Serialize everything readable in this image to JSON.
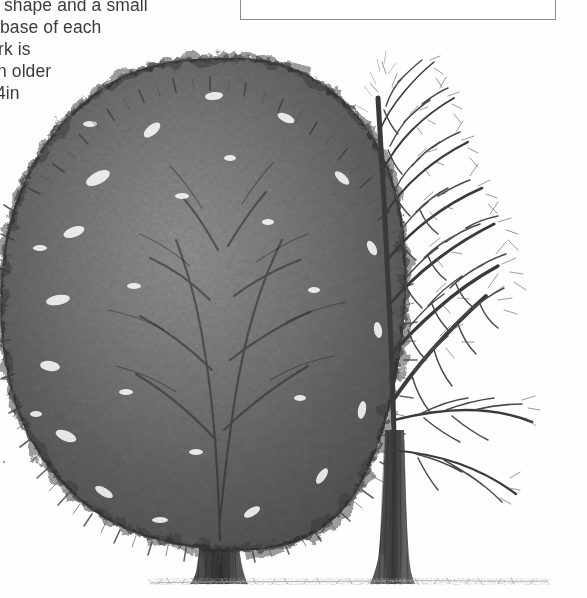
{
  "page": {
    "background_color": "#ffffff",
    "width": 587,
    "height": 598,
    "media_type": "scanned-book-page"
  },
  "body_text": {
    "note": "left column text is cropped at the left edge of the page",
    "lines": [
      "shape and a small",
      "base of each",
      "rk is",
      "n older",
      "4in"
    ]
  },
  "caption_box": {
    "border_color": "#8c8c8c",
    "fill_color": "#ffffff",
    "text": ""
  },
  "illustration": {
    "title": "Two deciduous trees",
    "style": "black-and-white pencil / halftone engraving",
    "ink_color": "#4a4a4a",
    "ground_color": "#9a9a9a",
    "subjects": [
      {
        "name": "tree-in-leaf",
        "label": "Summer tree in full leaf",
        "position": "left",
        "canopy": "dense rounded broadleaf crown",
        "trunk": "short stout fluted trunk"
      },
      {
        "name": "bare-tree",
        "label": "Winter tree without leaves",
        "position": "right",
        "canopy": "fine twiggy branch network",
        "trunk": "straight slender trunk"
      }
    ],
    "ground_line": "sparse grass hatching at base of both trunks"
  }
}
